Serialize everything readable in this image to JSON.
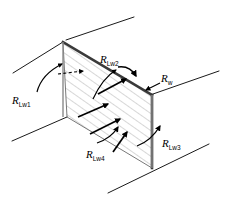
{
  "figure": {
    "background_color": "#ffffff",
    "line_color": "#1a1a1a",
    "hatch_color": "#9a9a9a",
    "edge_color": "#3a3a3a"
  },
  "labels": {
    "r_lw1": {
      "symbol": "R",
      "subscript": "Lw1",
      "text": "R_Lw1"
    },
    "r_lw2": {
      "symbol": "R",
      "subscript": "Lw2",
      "text": "R_Lw2"
    },
    "r_lw3": {
      "symbol": "R",
      "subscript": "Lw3",
      "text": "R_Lw3"
    },
    "r_lw4": {
      "symbol": "R",
      "subscript": "Lw4",
      "text": "R_Lw4"
    },
    "r_w": {
      "symbol": "R",
      "subscript": "w",
      "text": "R_w"
    }
  },
  "geometry": {
    "panel_vertices": [
      {
        "x": 63,
        "y": 42
      },
      {
        "x": 152,
        "y": 95
      },
      {
        "x": 152,
        "y": 168
      },
      {
        "x": 67,
        "y": 117
      }
    ],
    "duct_lines": [
      {
        "x1": 13,
        "y1": 73,
        "x2": 63,
        "y2": 42
      },
      {
        "x1": 66,
        "y1": 40,
        "x2": 134,
        "y2": 17
      },
      {
        "x1": 153,
        "y1": 94,
        "x2": 219,
        "y2": 71
      },
      {
        "x1": 12,
        "y1": 141,
        "x2": 67,
        "y2": 117
      },
      {
        "x1": 108,
        "y1": 193,
        "x2": 209,
        "y2": 144
      }
    ],
    "thick_edges": [
      {
        "x1": 63,
        "y1": 42,
        "x2": 152,
        "y2": 95
      },
      {
        "x1": 152,
        "y1": 95,
        "x2": 152,
        "y2": 168
      }
    ]
  }
}
